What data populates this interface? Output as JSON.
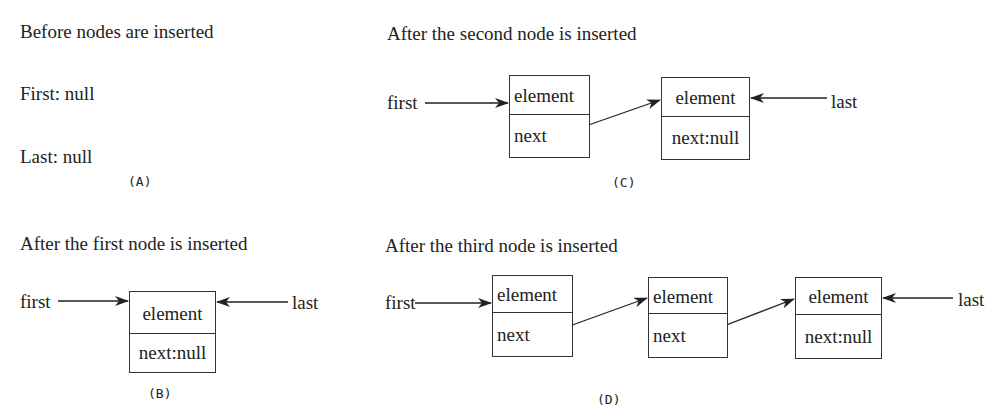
{
  "panels": {
    "A": {
      "title": "Before nodes are inserted",
      "first_text": "First: null",
      "last_text": "Last: null",
      "caption": "(A)"
    },
    "B": {
      "title": "After the first node is inserted",
      "first_label": "first",
      "last_label": "last",
      "nodes": [
        {
          "element": "element",
          "next": "next:null"
        }
      ],
      "caption": "(B)"
    },
    "C": {
      "title": "After the second node is inserted",
      "first_label": "first",
      "last_label": "last",
      "nodes": [
        {
          "element": "element",
          "next": "next"
        },
        {
          "element": "element",
          "next": "next:null"
        }
      ],
      "caption": "(C)"
    },
    "D": {
      "title": "After the third node is inserted",
      "first_label": "first",
      "last_label": "last",
      "nodes": [
        {
          "element": "element",
          "next": "next"
        },
        {
          "element": "element",
          "next": "next"
        },
        {
          "element": "element",
          "next": "next:null"
        }
      ],
      "caption": "(D)"
    }
  }
}
